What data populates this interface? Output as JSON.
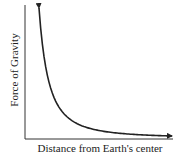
{
  "chart_data": {
    "type": "line",
    "title": "",
    "xlabel": "Distance from Earth's center",
    "ylabel": "Force of Gravity",
    "grid": false,
    "legend": null,
    "ticks": {
      "x": [],
      "y": []
    },
    "series": [
      {
        "name": "Force of Gravity vs Distance",
        "description": "Inverse-square decay (F ∝ 1/r²); both ends drawn as arrows, unlabeled axes",
        "x": [
          1,
          1.25,
          1.5,
          2,
          2.5,
          3,
          4,
          5,
          6,
          8
        ],
        "y": [
          1.0,
          0.64,
          0.444,
          0.25,
          0.16,
          0.111,
          0.0625,
          0.04,
          0.0278,
          0.0156
        ]
      }
    ]
  },
  "colors": {
    "background": "#ffffff",
    "ink": "#222222"
  }
}
